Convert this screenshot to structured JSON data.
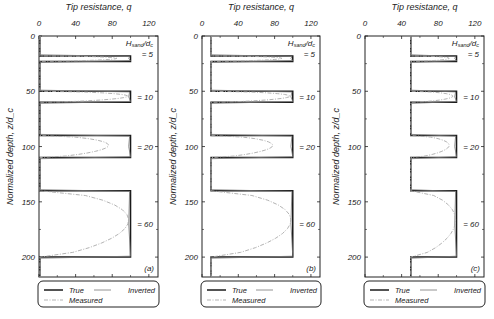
{
  "chart_data": [
    {
      "type": "line",
      "panel_label": "(a)",
      "title": "Tip resistance, q",
      "xlabel": "Tip resistance, q",
      "ylabel": "Normalized depth, z/d_c",
      "xlim": [
        0,
        130
      ],
      "ylim": [
        0,
        218
      ],
      "x_ticks": [
        0,
        40,
        80,
        120
      ],
      "y_ticks": [
        0,
        50,
        100,
        150,
        200
      ],
      "y_inverted": true,
      "clay_q": 1,
      "sand_q": 100,
      "layers": [
        {
          "top": 18,
          "bottom": 23,
          "label": "= 5",
          "measured_peak": 85
        },
        {
          "top": 50,
          "bottom": 60,
          "label": "= 10",
          "measured_peak": 97
        },
        {
          "top": 90,
          "bottom": 110,
          "label": "= 20",
          "measured_peak": 76
        },
        {
          "top": 140,
          "bottom": 200,
          "label": "= 60",
          "measured_peak": 98
        }
      ],
      "header_annotation": "H_sand/d_c"
    },
    {
      "type": "line",
      "panel_label": "(b)",
      "title": "Tip resistance, q",
      "xlabel": "Tip resistance, q",
      "ylabel": "Normalized depth, z/d_c",
      "xlim": [
        0,
        130
      ],
      "ylim": [
        0,
        218
      ],
      "x_ticks": [
        0,
        40,
        80,
        120
      ],
      "y_ticks": [
        0,
        50,
        100,
        150,
        200
      ],
      "y_inverted": true,
      "clay_q": 10,
      "sand_q": 100,
      "layers": [
        {
          "top": 18,
          "bottom": 23,
          "label": "= 5",
          "measured_peak": 88
        },
        {
          "top": 50,
          "bottom": 60,
          "label": "= 10",
          "measured_peak": 97
        },
        {
          "top": 90,
          "bottom": 110,
          "label": "= 20",
          "measured_peak": 78
        },
        {
          "top": 140,
          "bottom": 200,
          "label": "= 60",
          "measured_peak": 98
        }
      ],
      "header_annotation": "H_sand/d_c"
    },
    {
      "type": "line",
      "panel_label": "(c)",
      "title": "Tip resistance, q",
      "xlabel": "Tip resistance, q",
      "ylabel": "Normalized depth, z/d_c",
      "xlim": [
        0,
        130
      ],
      "ylim": [
        0,
        218
      ],
      "x_ticks": [
        0,
        40,
        80,
        120
      ],
      "y_ticks": [
        0,
        50,
        100,
        150,
        200
      ],
      "y_inverted": true,
      "clay_q": 50,
      "sand_q": 100,
      "layers": [
        {
          "top": 18,
          "bottom": 23,
          "label": "= 5",
          "measured_peak": 92
        },
        {
          "top": 50,
          "bottom": 60,
          "label": "= 10",
          "measured_peak": 96
        },
        {
          "top": 90,
          "bottom": 110,
          "label": "= 20",
          "measured_peak": 92
        },
        {
          "top": 140,
          "bottom": 200,
          "label": "= 60",
          "measured_peak": 99
        }
      ],
      "header_annotation": "H_sand/d_c"
    }
  ],
  "legend": {
    "true_label": "True",
    "inverted_label": "Inverted",
    "measured_label": "Measured"
  },
  "colors": {
    "true": "#1a1a1a",
    "inverted": "#777777",
    "measured": "#aaaaaa",
    "axis": "#222222"
  }
}
